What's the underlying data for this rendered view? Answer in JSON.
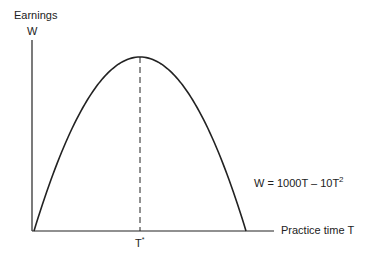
{
  "chart_data": {
    "type": "line",
    "title": "",
    "ylabel_top": "Earnings",
    "ylabel": "W",
    "xlabel": "Practice time  T",
    "equation": "W = 1000T – 10T",
    "equation_exponent": "2",
    "peak_marker_label": "T*",
    "peak_marker_base": "T",
    "peak_marker_sup": "*",
    "function": "W = 1000T - 10T^2",
    "x_range": [
      0,
      100
    ],
    "peak": {
      "T": 50,
      "W": 25000
    },
    "x": [
      0,
      10,
      20,
      30,
      40,
      50,
      60,
      70,
      80,
      90,
      100
    ],
    "values": [
      0,
      9000,
      16000,
      21000,
      24000,
      25000,
      24000,
      21000,
      16000,
      9000,
      0
    ],
    "grid": false
  },
  "colors": {
    "line": "#222222",
    "background": "#ffffff"
  }
}
